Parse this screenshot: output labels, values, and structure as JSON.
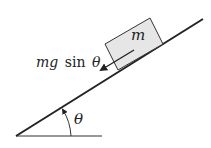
{
  "diagram": {
    "mass_label": "m",
    "force_label_prefix": "mg",
    "force_label_fn": "sin",
    "force_label_var": "θ",
    "angle_label": "θ",
    "colors": {
      "line": "#222222",
      "block_fill": "#e6e6e6",
      "block_stroke": "#333333"
    }
  }
}
